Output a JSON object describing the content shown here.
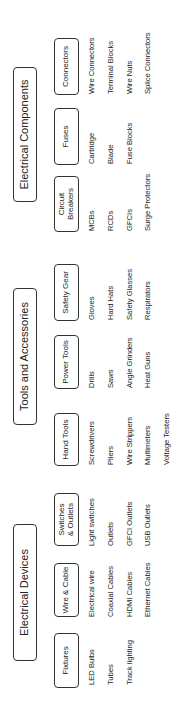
{
  "groups": [
    {
      "title": "Electrical Devices",
      "categories": [
        {
          "label": "Fixtures",
          "items": [
            "LED Bulbs",
            "Tubes",
            "Track lighting"
          ]
        },
        {
          "label": "Wire & Cable",
          "items": [
            "Electrical wire",
            "Coaxial Cables",
            "HDMI Cables",
            "Ethernet Cables"
          ]
        },
        {
          "label": "Switches & Outlets",
          "items": [
            "Light switches",
            "Outlets",
            "GFCI Outlets",
            "USB Outlets"
          ]
        }
      ]
    },
    {
      "title": "Tools and Accessories",
      "categories": [
        {
          "label": "Hand Tools",
          "items": [
            "Screwdrivers",
            "Pliers",
            "Wire Strippers",
            "Multimeters",
            "Voltage Testers"
          ]
        },
        {
          "label": "Power Tools",
          "items": [
            "Drills",
            "Saws",
            "Angle Grinders",
            "Heat Guns"
          ]
        },
        {
          "label": "Safety Gear",
          "items": [
            "Gloves",
            "Hard Hats",
            "Safety Glasses",
            "Respirators"
          ]
        }
      ]
    },
    {
      "title": "Electrical Components",
      "categories": [
        {
          "label": "Circuit Breakers",
          "items": [
            "MCBs",
            "RCDs",
            "GFCIs",
            "Surge Protectors"
          ]
        },
        {
          "label": "Fuses",
          "items": [
            "Cartridge",
            "Blade",
            "Fuse Blocks"
          ]
        },
        {
          "label": "Connectors",
          "items": [
            "Wire Connectors",
            "Terminal Blocks",
            "Wire Nuts",
            "Splice Connectors"
          ]
        }
      ]
    }
  ],
  "colors": {
    "border": "#333333",
    "text": "#222222",
    "background": "#ffffff"
  }
}
